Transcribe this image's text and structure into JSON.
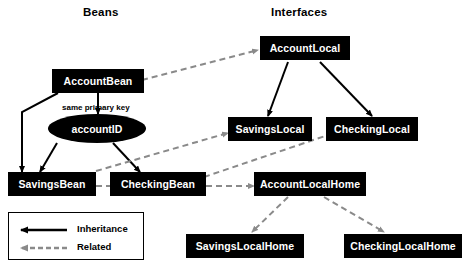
{
  "diagram": {
    "columns": [
      {
        "id": "beans",
        "title": "Beans"
      },
      {
        "id": "interfaces",
        "title": "Interfaces"
      }
    ],
    "nodes": [
      {
        "id": "account-bean",
        "label": "AccountBean",
        "shape": "rect"
      },
      {
        "id": "account-id",
        "label": "accountID",
        "shape": "ellipse"
      },
      {
        "id": "savings-bean",
        "label": "SavingsBean",
        "shape": "rect"
      },
      {
        "id": "checking-bean",
        "label": "CheckingBean",
        "shape": "rect"
      },
      {
        "id": "account-local",
        "label": "AccountLocal",
        "shape": "rect"
      },
      {
        "id": "savings-local",
        "label": "SavingsLocal",
        "shape": "rect"
      },
      {
        "id": "checking-local",
        "label": "CheckingLocal",
        "shape": "rect"
      },
      {
        "id": "account-local-home",
        "label": "AccountLocalHome",
        "shape": "rect"
      },
      {
        "id": "savings-local-home",
        "label": "SavingsLocalHome",
        "shape": "rect"
      },
      {
        "id": "checking-local-home",
        "label": "CheckingLocalHome",
        "shape": "rect"
      }
    ],
    "edge_labels": [
      {
        "id": "same-primary-key",
        "text": "same primary key"
      }
    ],
    "legend": {
      "items": [
        {
          "id": "inheritance",
          "label": "Inheritance",
          "style": "solid",
          "color": "#000000"
        },
        {
          "id": "related",
          "label": "Related",
          "style": "dashed",
          "color": "#8a8a8a"
        }
      ]
    },
    "edges": [
      {
        "from": "account-bean",
        "to": "savings-bean",
        "type": "inheritance"
      },
      {
        "from": "account-bean",
        "to": "checking-bean",
        "type": "inheritance"
      },
      {
        "from": "account-id",
        "to": "savings-bean",
        "type": "inheritance"
      },
      {
        "from": "account-id",
        "to": "checking-bean",
        "type": "inheritance"
      },
      {
        "from": "account-bean",
        "to": "account-local",
        "type": "related"
      },
      {
        "from": "account-local",
        "to": "savings-local",
        "type": "inheritance"
      },
      {
        "from": "account-local",
        "to": "checking-local",
        "type": "inheritance"
      },
      {
        "from": "savings-bean",
        "to": "savings-local",
        "type": "related"
      },
      {
        "from": "checking-bean",
        "to": "checking-local",
        "type": "related"
      },
      {
        "from": "savings-bean",
        "to": "account-local-home",
        "type": "related"
      },
      {
        "from": "account-local-home",
        "to": "savings-local-home",
        "type": "related"
      },
      {
        "from": "account-local-home",
        "to": "checking-local-home",
        "type": "related"
      }
    ],
    "colors": {
      "node_fill": "#000000",
      "node_text": "#ffffff",
      "inheritance": "#000000",
      "related": "#8a8a8a",
      "background": "#ffffff"
    }
  }
}
